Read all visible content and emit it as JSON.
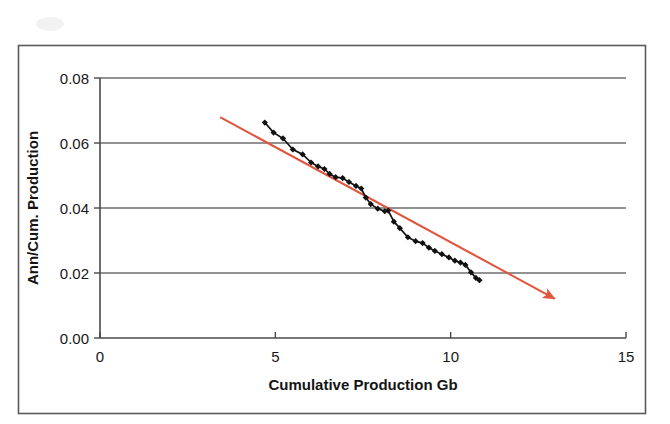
{
  "chart_data": {
    "type": "line",
    "title": "",
    "subtitle": "",
    "xlabel": "Cumulative Production Gb",
    "ylabel": "Ann/Cum. Production",
    "xlim": [
      0,
      15
    ],
    "ylim": [
      0.0,
      0.08
    ],
    "xticks": [
      0,
      5,
      10,
      15
    ],
    "xtick_labels": [
      "0",
      "5",
      "10",
      "15"
    ],
    "yticks": [
      0.0,
      0.02,
      0.04,
      0.06,
      0.08
    ],
    "ytick_labels": [
      "0.00",
      "0.02",
      "0.04",
      "0.06",
      "0.08"
    ],
    "grid": "horizontal",
    "legend": "none",
    "series": [
      {
        "name": "Ann/Cum. Production data",
        "marker": "diamond",
        "color": "#111111",
        "x": [
          4.7,
          4.95,
          5.22,
          5.5,
          5.78,
          6.02,
          6.22,
          6.4,
          6.55,
          6.72,
          6.92,
          7.1,
          7.3,
          7.45,
          7.58,
          7.72,
          7.92,
          8.12,
          8.22,
          8.38,
          8.55,
          8.78,
          9.0,
          9.2,
          9.38,
          9.55,
          9.75,
          9.95,
          10.12,
          10.28,
          10.42,
          10.58,
          10.72,
          10.82
        ],
        "y": [
          0.0663,
          0.0632,
          0.0614,
          0.058,
          0.0565,
          0.054,
          0.0528,
          0.052,
          0.0505,
          0.0495,
          0.0492,
          0.048,
          0.0468,
          0.046,
          0.0432,
          0.0412,
          0.0398,
          0.039,
          0.0392,
          0.0358,
          0.0338,
          0.031,
          0.0298,
          0.0292,
          0.0278,
          0.0268,
          0.0258,
          0.0248,
          0.0238,
          0.0232,
          0.0225,
          0.0202,
          0.0185,
          0.0178
        ]
      }
    ],
    "annotations": [
      {
        "kind": "trend-arrow",
        "color": "#e2543d",
        "x_start": 3.45,
        "y_start": 0.0678,
        "x_end": 12.95,
        "y_end": 0.0122,
        "arrowhead": "end"
      }
    ]
  }
}
